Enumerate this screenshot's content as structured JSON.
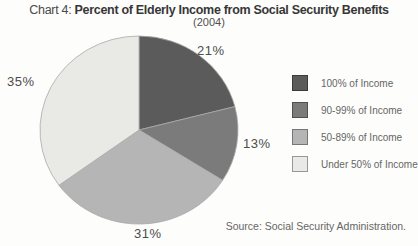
{
  "title": {
    "prefix": "Chart 4: ",
    "main": "Percent of Elderly Income from Social Security Benefits",
    "subtitle": "(2004)"
  },
  "source": "Source: Social Security Administration.",
  "colors": {
    "slice_100": "#5b5b5b",
    "slice_90_99": "#7b7b7b",
    "slice_50_89": "#b5b5b5",
    "slice_under_50": "#e9e9e5"
  },
  "chart_data": {
    "type": "pie",
    "title": "Chart 4: Percent of Elderly Income from Social Security Benefits",
    "subtitle": "(2004)",
    "start_angle_deg": 0,
    "direction": "clockwise",
    "legend_position": "right",
    "slices": [
      {
        "label": "100% of Income",
        "value": 21,
        "pct_label": "21%",
        "color": "#5b5b5b"
      },
      {
        "label": "90-99% of Income",
        "value": 13,
        "pct_label": "13%",
        "color": "#7b7b7b"
      },
      {
        "label": "50-89% of Income",
        "value": 31,
        "pct_label": "31%",
        "color": "#b5b5b5"
      },
      {
        "label": "Under 50% of Income",
        "value": 35,
        "pct_label": "35%",
        "color": "#e9e9e5"
      }
    ],
    "source": "Source: Social Security Administration."
  }
}
